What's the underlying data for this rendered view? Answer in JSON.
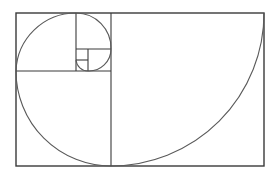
{
  "diagram": {
    "colors": {
      "background": "#ffffff",
      "lines": "#3a3a3a",
      "spiral": "#5a5a5a"
    },
    "rectangle": {
      "x": 16,
      "y": 13,
      "width": 248,
      "height": 153
    },
    "squares": [
      {
        "name": "square-153",
        "x": 111,
        "y": 13,
        "size": 153
      },
      {
        "name": "square-95",
        "x": 16,
        "y": 71,
        "size": 95
      },
      {
        "name": "square-58",
        "x": 16,
        "y": 13,
        "size": 60
      },
      {
        "name": "square-35",
        "x": 76,
        "y": 13,
        "size": 35
      },
      {
        "name": "square-22",
        "x": 88,
        "y": 49,
        "size": 22
      },
      {
        "name": "square-12",
        "x": 76,
        "y": 60,
        "size": 12
      }
    ]
  }
}
